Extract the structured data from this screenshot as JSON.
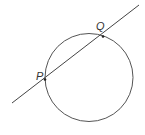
{
  "diagram": {
    "type": "circle-secant",
    "circle": {
      "cx": 89,
      "cy": 77.5,
      "r": 44,
      "stroke": "#555555"
    },
    "line": {
      "x1": 12,
      "y1": 103,
      "x2": 139,
      "y2": 5,
      "stroke": "#444444"
    },
    "points": [
      {
        "name": "P",
        "label": "P",
        "x": 45,
        "y": 79.5,
        "label_x": 36,
        "label_y": 80
      },
      {
        "name": "Q",
        "label": "Q",
        "x": 103,
        "y": 36.5,
        "label_x": 96,
        "label_y": 30
      }
    ]
  }
}
